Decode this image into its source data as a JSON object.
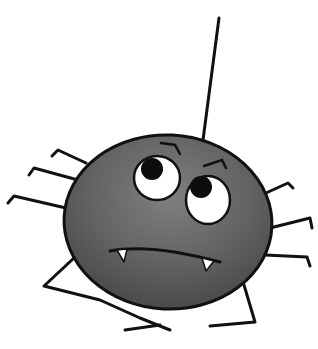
{
  "illustration": {
    "subject": "cartoon spider",
    "colors": {
      "background": "#ffffff",
      "body": "#5e5e5e",
      "body_highlight": "#7a7a7a",
      "outline": "#111111",
      "eye_white": "#ffffff",
      "pupil": "#0d0d0d",
      "fang": "#ffffff"
    }
  }
}
